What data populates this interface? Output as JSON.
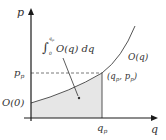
{
  "diagram": {
    "axes": {
      "x_label": "q",
      "y_label": "p"
    },
    "labels": {
      "p_p_sub": "p",
      "p_p_subscript": "p",
      "q_p": "q",
      "q_p_subscript": "p",
      "intercept": "O(0)",
      "curve": "O(q)",
      "point": "(q",
      "point_sub1": "p",
      "point_mid": ", p",
      "point_sub2": "p",
      "point_end": ")",
      "integral_lower": "0",
      "integral_upper": "q",
      "integral_upper_sub": "p",
      "integral_body": "O(q) dq"
    },
    "colors": {
      "axis": "#1a1a1a",
      "curve": "#555555",
      "shade": "#e6e6e6",
      "text": "#333333"
    }
  }
}
